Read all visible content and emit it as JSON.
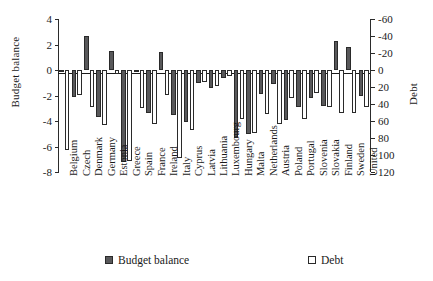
{
  "chart_data": {
    "type": "bar",
    "title": "",
    "xlabel": "",
    "ylabel": "Budget balance",
    "y2label": "Debt",
    "grid": false,
    "legend_position": "bottom",
    "ylim": [
      -8,
      4
    ],
    "yticks": [
      4,
      2,
      0,
      -2,
      -4,
      -6,
      -8
    ],
    "y2lim": [
      120,
      -60
    ],
    "y2ticks": [
      -60,
      -40,
      -20,
      0,
      20,
      40,
      60,
      80,
      100,
      120
    ],
    "y2_inverted": true,
    "categories": [
      "Belgium",
      "Czech",
      "Denmark",
      "Germany",
      "Estonia",
      "Greece",
      "Spain",
      "France",
      "Ireland",
      "Italy",
      "Cyprus",
      "Latvia",
      "Lithuania",
      "Luxembourg",
      "Hungary",
      "Malta",
      "Netherlands",
      "Austria",
      "Poland",
      "Portugal",
      "Slovenia",
      "Slovakia",
      "Finland",
      "Sweden",
      "United"
    ],
    "series": [
      {
        "name": "Budget balance",
        "axis": "left",
        "color": "#58585a",
        "values": [
          -0.1,
          -2.1,
          2.7,
          -3.7,
          1.5,
          -7.2,
          -0.1,
          -3.4,
          1.45,
          -3.5,
          -4.1,
          -1.0,
          -1.4,
          -0.6,
          -5.3,
          -5.0,
          -1.9,
          -1.1,
          -3.9,
          -2.9,
          -2.2,
          -2.8,
          2.3,
          1.8,
          -2.0
        ]
      },
      {
        "name": "Debt",
        "axis": "right",
        "color": "#ffffff",
        "values": [
          94,
          29,
          43,
          65,
          5,
          107,
          45,
          64,
          29,
          103,
          70,
          14,
          19,
          7,
          58,
          74,
          52,
          63,
          33,
          58,
          27,
          43,
          51,
          50,
          43
        ]
      }
    ],
    "legend": [
      "Budget balance",
      "Debt"
    ]
  },
  "axes": {
    "left_title": "Budget balance",
    "right_title": "Debt"
  },
  "legend": {
    "budget_label": "Budget balance",
    "debt_label": "Debt"
  }
}
